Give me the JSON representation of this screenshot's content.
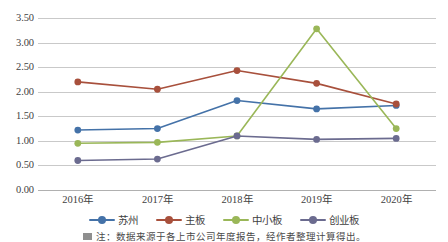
{
  "chart_data": {
    "type": "line",
    "title": "",
    "xlabel": "",
    "ylabel": "",
    "categories": [
      "2016年",
      "2017年",
      "2018年",
      "2019年",
      "2020年"
    ],
    "ylim": [
      0.0,
      3.5
    ],
    "yticks": [
      "0.00",
      "0.50",
      "1.00",
      "1.50",
      "2.00",
      "2.50",
      "3.00",
      "3.50"
    ],
    "ytick_values": [
      0.0,
      0.5,
      1.0,
      1.5,
      2.0,
      2.5,
      3.0,
      3.5
    ],
    "grid": true,
    "legend_position": "bottom",
    "series": [
      {
        "name": "苏州",
        "color": "#4472a8",
        "values": [
          1.22,
          1.25,
          1.82,
          1.65,
          1.72
        ]
      },
      {
        "name": "主板",
        "color": "#a8503c",
        "values": [
          2.2,
          2.05,
          2.43,
          2.17,
          1.75
        ]
      },
      {
        "name": "中小板",
        "color": "#9ab758",
        "values": [
          0.95,
          0.97,
          1.1,
          3.28,
          1.25
        ]
      },
      {
        "name": "创业板",
        "color": "#6b6b8f",
        "values": [
          0.6,
          0.63,
          1.1,
          1.03,
          1.05
        ]
      }
    ]
  },
  "caption": {
    "text": "注：数据来源于各上市公司年度报告，经作者整理计算得出。"
  }
}
